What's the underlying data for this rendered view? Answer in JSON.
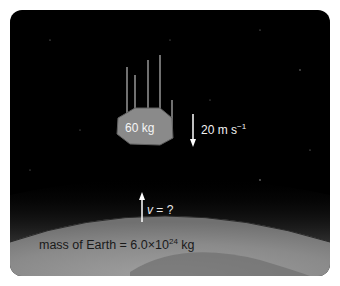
{
  "diagram": {
    "meteor": {
      "mass_label": "60 kg",
      "fill": "#8a8a8a"
    },
    "meteor_velocity": {
      "label": "20 m s",
      "exponent": "−1"
    },
    "earth_velocity": {
      "symbol": "v",
      "suffix": " = ?"
    },
    "earth": {
      "label_prefix": "mass of Earth = 6.0×10",
      "label_exponent": "24",
      "label_suffix": " kg"
    },
    "colors": {
      "space": "#000000",
      "earth_surface": "#8c8c8c",
      "atmosphere_glow": "#5a5a5a",
      "arrow": "#ffffff"
    }
  }
}
